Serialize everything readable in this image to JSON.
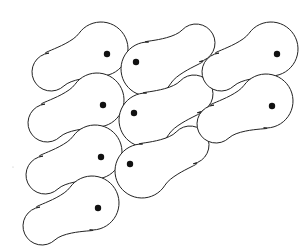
{
  "diagram": {
    "colors": {
      "outline": "#222222",
      "dot": "#111111",
      "fill": "#ffffff",
      "background": "#ffffff"
    },
    "cell_types": {
      "A": {
        "orientation": "head-right, lobe lower-left",
        "head_offset": [
          -6,
          -5
        ],
        "head_r": 27,
        "lobe_offset": [
          -56,
          18
        ],
        "lobe_r": 19
      },
      "B": {
        "orientation": "head-left, lobe upper-right",
        "head_offset": [
          12,
          7
        ],
        "head_r": 27,
        "lobe_offset": [
          60,
          -19
        ],
        "lobe_r": 19
      }
    },
    "cells": [
      {
        "type": "A",
        "dot": [
          107,
          54
        ]
      },
      {
        "type": "A",
        "dot": [
          103,
          105
        ]
      },
      {
        "type": "A",
        "dot": [
          101,
          157
        ]
      },
      {
        "type": "A",
        "dot": [
          98,
          208
        ]
      },
      {
        "type": "B",
        "dot": [
          136,
          62
        ]
      },
      {
        "type": "B",
        "dot": [
          134,
          113
        ]
      },
      {
        "type": "B",
        "dot": [
          130,
          164
        ]
      },
      {
        "type": "A",
        "dot": [
          277,
          54
        ]
      },
      {
        "type": "A",
        "dot": [
          272,
          106
        ]
      }
    ],
    "specks": [
      [
        13,
        167
      ]
    ]
  }
}
